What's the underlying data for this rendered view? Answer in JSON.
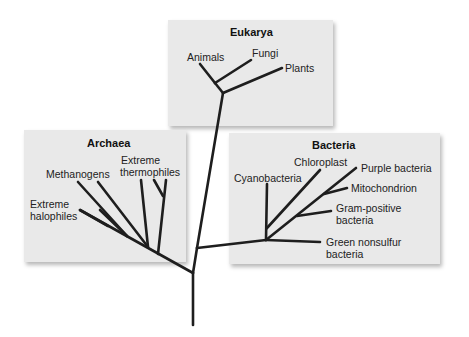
{
  "domains": {
    "eukarya": {
      "title": "Eukarya",
      "labels": [
        "Animals",
        "Fungi",
        "Plants"
      ]
    },
    "archaea": {
      "title": "Archaea",
      "labels": [
        "Methanogens",
        "Extreme\nthermophiles",
        "Extreme\nhalophiles"
      ],
      "label_lines": {
        "methanogens": "Methanogens",
        "thermophiles_1": "Extreme",
        "thermophiles_2": "thermophiles",
        "halophiles_1": "Extreme",
        "halophiles_2": "halophiles"
      }
    },
    "bacteria": {
      "title": "Bacteria",
      "label_lines": {
        "cyanobacteria": "Cyanobacteria",
        "chloroplast": "Chloroplast",
        "purple": "Purple bacteria",
        "mitochondrion": "Mitochondrion",
        "gram_1": "Gram-positive",
        "gram_2": "bacteria",
        "green_1": "Green nonsulfur",
        "green_2": "bacteria"
      }
    }
  },
  "colors": {
    "box_fill": "#e9e9e9",
    "branch": "#1e1e1e",
    "text": "#222222"
  }
}
